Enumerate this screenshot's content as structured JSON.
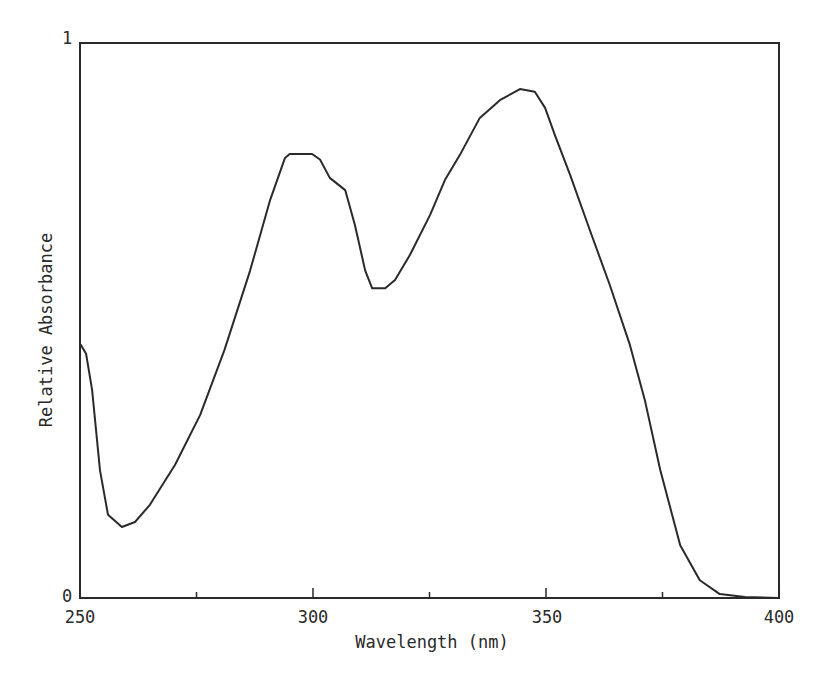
{
  "chart_data": {
    "type": "line",
    "title": "",
    "xlabel": "Wavelength (nm)",
    "ylabel": "Relative Absorbance",
    "xlim": [
      250,
      400
    ],
    "ylim": [
      0,
      1
    ],
    "grid": false,
    "legend": null,
    "x_ticks": {
      "major": [
        250,
        300,
        350,
        400
      ],
      "major_labels": [
        "250",
        "300",
        "350",
        "400"
      ],
      "minor": [
        275,
        325,
        375
      ]
    },
    "y_ticks": {
      "values": [
        0,
        1
      ],
      "labels": [
        "0",
        "1"
      ]
    },
    "series": [
      {
        "name": "Relative Absorbance",
        "color": "#2a2a2a",
        "x": [
          250.2,
          251.3,
          252.6,
          254.3,
          256.0,
          259.0,
          261.8,
          265.0,
          270.4,
          275.8,
          281.0,
          286.5,
          290.8,
          294.0,
          295.0,
          299.8,
          301.5,
          303.6,
          306.9,
          309.0,
          311.2,
          312.7,
          315.5,
          317.6,
          320.8,
          325.1,
          328.3,
          331.5,
          335.8,
          340.1,
          344.4,
          347.6,
          349.8,
          351.9,
          355.2,
          359.4,
          363.7,
          368.0,
          371.2,
          374.5,
          378.8,
          383.0,
          387.3,
          392.7,
          400.0
        ],
        "y": [
          0.456,
          0.44,
          0.375,
          0.23,
          0.15,
          0.128,
          0.137,
          0.168,
          0.24,
          0.33,
          0.447,
          0.59,
          0.717,
          0.793,
          0.8,
          0.8,
          0.79,
          0.757,
          0.735,
          0.672,
          0.59,
          0.558,
          0.558,
          0.573,
          0.618,
          0.69,
          0.753,
          0.798,
          0.865,
          0.897,
          0.917,
          0.912,
          0.883,
          0.834,
          0.762,
          0.663,
          0.564,
          0.456,
          0.357,
          0.231,
          0.095,
          0.032,
          0.007,
          0.002,
          0.0
        ]
      }
    ],
    "annotations": {
      "peaks": [
        {
          "x": 297,
          "y": 0.8,
          "note": "flat-topped band ~295-300 nm"
        },
        {
          "x": 345,
          "y": 0.92,
          "note": "absolute maximum"
        }
      ],
      "minima": [
        {
          "x": 259,
          "y": 0.128
        },
        {
          "x": 314,
          "y": 0.558
        }
      ],
      "shoulder": {
        "x": 307,
        "y": 0.735
      }
    }
  },
  "axes": {
    "x_title": "Wavelength (nm)",
    "y_title": "Relative Absorbance",
    "x_labels": [
      "250",
      "300",
      "350",
      "400"
    ],
    "y_labels": {
      "top": "1",
      "bottom": "0"
    }
  },
  "style": {
    "line_color": "#2a2a2a",
    "frame_color": "#2a2a2a",
    "background": "#ffffff"
  },
  "plot_box": {
    "left": 80,
    "top": 43,
    "right": 779,
    "bottom": 598
  }
}
